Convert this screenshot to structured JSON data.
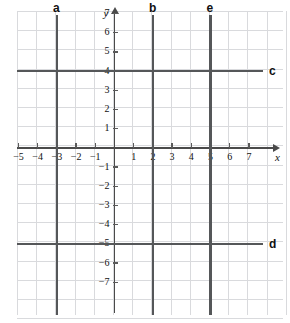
{
  "figure": {
    "type": "coordinate-plane",
    "axis_names": {
      "x": "x",
      "y": "y"
    },
    "x_axis": {
      "min": -5,
      "max": 7,
      "ticks": [
        -5,
        -4,
        -3,
        -2,
        -1,
        1,
        2,
        3,
        4,
        5,
        6,
        7
      ],
      "tick_labels": [
        "−5",
        "−4",
        "−3",
        "−2",
        "−1",
        "1",
        "2",
        "3",
        "4",
        "5",
        "6",
        "7"
      ]
    },
    "y_axis": {
      "min": -7,
      "max": 7,
      "ticks": [
        7,
        6,
        5,
        4,
        3,
        2,
        1,
        -1,
        -2,
        -3,
        -4,
        -5,
        -6,
        -7
      ],
      "tick_labels": [
        "7",
        "6",
        "5",
        "4",
        "3",
        "2",
        "1",
        "−1",
        "−2",
        "−3",
        "−4",
        "−5",
        "−6",
        "−7"
      ]
    },
    "grid": {
      "visible": true,
      "color": "#d9dadd",
      "spacing_units": 1
    },
    "colors": {
      "axis": "#4a4a4a",
      "plot_line": "#555759",
      "grid": "#d9dadd",
      "text": "#111111"
    }
  },
  "chart_data": {
    "type": "line",
    "title": "",
    "xlabel": "x",
    "ylabel": "y",
    "xlim": [
      -5,
      7
    ],
    "ylim": [
      -7,
      7
    ],
    "grid": true,
    "legend": "inline-labels",
    "series": [
      {
        "name": "a",
        "orientation": "vertical",
        "equation": "x = -3",
        "value": -3,
        "label_position": "top"
      },
      {
        "name": "b",
        "orientation": "vertical",
        "equation": "x = 2",
        "value": 2,
        "label_position": "top"
      },
      {
        "name": "e",
        "orientation": "vertical",
        "equation": "x = 5",
        "value": 5,
        "label_position": "top"
      },
      {
        "name": "c",
        "orientation": "horizontal",
        "equation": "y = 4",
        "value": 4,
        "label_position": "right"
      },
      {
        "name": "d",
        "orientation": "horizontal",
        "equation": "y = -5",
        "value": -5,
        "label_position": "right"
      }
    ]
  }
}
